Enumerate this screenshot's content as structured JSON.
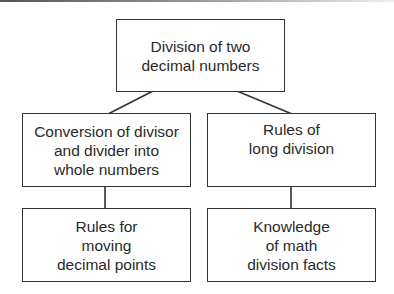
{
  "diagram": {
    "type": "tree",
    "root": {
      "id": "root",
      "label": "Division of two\ndecimal numbers"
    },
    "nodes": [
      {
        "id": "conversion",
        "label": "Conversion of divisor\nand divider into\nwhole numbers",
        "parent": "root"
      },
      {
        "id": "long-division",
        "label": "Rules of\nlong division",
        "parent": "root"
      },
      {
        "id": "moving-points",
        "label": "Rules for\nmoving\ndecimal points",
        "parent": "conversion"
      },
      {
        "id": "math-facts",
        "label": "Knowledge\nof math\ndivision facts",
        "parent": "long-division"
      }
    ],
    "colors": {
      "border": "#333333",
      "text": "#2a2a2a",
      "background": "#ffffff"
    }
  }
}
